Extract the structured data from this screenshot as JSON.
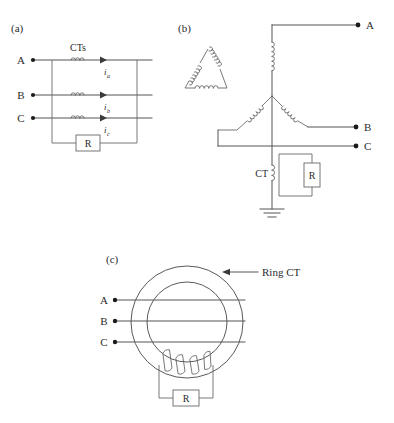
{
  "figure": {
    "background_color": "#ffffff",
    "line_color": "#555555",
    "text_color": "#2b2b2b"
  },
  "panels": {
    "a": {
      "label": "(a)",
      "cts_label": "CTs",
      "phases": [
        {
          "name": "A",
          "label": "A"
        },
        {
          "name": "B",
          "label": "B"
        },
        {
          "name": "C",
          "label": "C"
        }
      ],
      "currents": [
        {
          "symbol": "i",
          "subscript": "a"
        },
        {
          "symbol": "i",
          "subscript": "b"
        },
        {
          "symbol": "i",
          "subscript": "c"
        }
      ],
      "resistor_label": "R"
    },
    "b": {
      "label": "(b)",
      "terminals": [
        {
          "name": "A",
          "label": "A"
        },
        {
          "name": "B",
          "label": "B"
        },
        {
          "name": "C",
          "label": "C"
        }
      ],
      "ct_label": "CT",
      "resistor_label": "R",
      "winding_primary": "delta",
      "winding_secondary": "wye",
      "has_ground": true
    },
    "c": {
      "label": "(c)",
      "ring_ct_label": "Ring CT",
      "phases": [
        {
          "name": "A",
          "label": "A"
        },
        {
          "name": "B",
          "label": "B"
        },
        {
          "name": "C",
          "label": "C"
        }
      ],
      "resistor_label": "R"
    }
  }
}
